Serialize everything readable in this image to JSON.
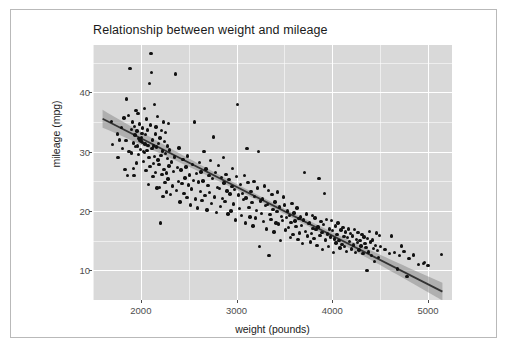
{
  "chart_data": {
    "type": "scatter",
    "title": "Relationship between weight and mileage",
    "xlabel": "weight (pounds)",
    "ylabel": "mileage (mpg)",
    "xlim": [
      1500,
      5250
    ],
    "ylim": [
      5,
      48
    ],
    "x_ticks": [
      2000,
      3000,
      4000,
      5000
    ],
    "x_tick_labels": [
      "2000",
      "3000",
      "4000",
      "5000"
    ],
    "y_ticks": [
      10,
      20,
      30,
      40
    ],
    "y_tick_labels": [
      "10",
      "20",
      "30",
      "40"
    ],
    "x_minor_ticks": [
      1500,
      2500,
      3500,
      4500,
      5000
    ],
    "y_minor_ticks": [
      15,
      25,
      35,
      45
    ],
    "grid": true,
    "legend": "none",
    "panel_background": "#d9d9d9",
    "grid_color": "#ffffff",
    "point_color": "#111111",
    "fit_line_color": "#333333",
    "fit_ribbon_color": "#8c8c8c",
    "fit": {
      "type": "linear",
      "intercept": 48.7,
      "slope": -0.00821,
      "x_start": 1600,
      "x_end": 5150,
      "ci_halfwidth_min": 0.45,
      "ci_halfwidth_max": 1.5
    },
    "points": [
      [
        1695,
        35.1
      ],
      [
        1705,
        31.2
      ],
      [
        1755,
        33.0
      ],
      [
        1760,
        29.0
      ],
      [
        1775,
        32.0
      ],
      [
        1800,
        34.1
      ],
      [
        1810,
        30.5
      ],
      [
        1825,
        35.7
      ],
      [
        1835,
        27.0
      ],
      [
        1845,
        31.9
      ],
      [
        1850,
        38.9
      ],
      [
        1860,
        26.0
      ],
      [
        1870,
        36.1
      ],
      [
        1875,
        30.0
      ],
      [
        1885,
        44.0
      ],
      [
        1900,
        33.8
      ],
      [
        1905,
        29.8
      ],
      [
        1915,
        35.0
      ],
      [
        1920,
        31.5
      ],
      [
        1925,
        27.2
      ],
      [
        1930,
        26.0
      ],
      [
        1935,
        34.3
      ],
      [
        1940,
        32.8
      ],
      [
        1945,
        30.9
      ],
      [
        1950,
        37.0
      ],
      [
        1955,
        28.1
      ],
      [
        1960,
        33.5
      ],
      [
        1965,
        31.0
      ],
      [
        1970,
        36.4
      ],
      [
        1975,
        29.5
      ],
      [
        1980,
        32.2
      ],
      [
        1985,
        34.7
      ],
      [
        1990,
        31.9
      ],
      [
        1995,
        30.4
      ],
      [
        2000,
        31.8
      ],
      [
        2005,
        32.4
      ],
      [
        2010,
        33.1
      ],
      [
        2015,
        31.6
      ],
      [
        2020,
        34.0
      ],
      [
        2025,
        30.0
      ],
      [
        2030,
        28.4
      ],
      [
        2035,
        37.3
      ],
      [
        2040,
        29.9
      ],
      [
        2045,
        31.3
      ],
      [
        2050,
        32.9
      ],
      [
        2055,
        26.8
      ],
      [
        2060,
        35.5
      ],
      [
        2065,
        30.2
      ],
      [
        2070,
        33.7
      ],
      [
        2075,
        31.1
      ],
      [
        2080,
        24.5
      ],
      [
        2085,
        29.0
      ],
      [
        2090,
        41.5
      ],
      [
        2095,
        27.5
      ],
      [
        2100,
        34.5
      ],
      [
        2105,
        46.6
      ],
      [
        2110,
        43.4
      ],
      [
        2115,
        30.5
      ],
      [
        2120,
        32.0
      ],
      [
        2125,
        25.8
      ],
      [
        2130,
        28.0
      ],
      [
        2135,
        31.0
      ],
      [
        2140,
        38.0
      ],
      [
        2145,
        29.2
      ],
      [
        2150,
        33.0
      ],
      [
        2155,
        26.5
      ],
      [
        2160,
        34.2
      ],
      [
        2165,
        30.8
      ],
      [
        2170,
        23.9
      ],
      [
        2175,
        35.9
      ],
      [
        2180,
        28.6
      ],
      [
        2185,
        31.4
      ],
      [
        2190,
        27.8
      ],
      [
        2195,
        24.0
      ],
      [
        2200,
        32.3
      ],
      [
        2205,
        18.0
      ],
      [
        2210,
        29.4
      ],
      [
        2215,
        33.6
      ],
      [
        2220,
        26.2
      ],
      [
        2225,
        30.1
      ],
      [
        2230,
        22.5
      ],
      [
        2235,
        35.0
      ],
      [
        2240,
        27.0
      ],
      [
        2245,
        31.7
      ],
      [
        2250,
        24.8
      ],
      [
        2255,
        29.7
      ],
      [
        2260,
        33.2
      ],
      [
        2265,
        26.4
      ],
      [
        2270,
        23.2
      ],
      [
        2275,
        28.9
      ],
      [
        2280,
        31.0
      ],
      [
        2285,
        25.4
      ],
      [
        2290,
        34.8
      ],
      [
        2295,
        27.6
      ],
      [
        2300,
        30.3
      ],
      [
        2310,
        22.8
      ],
      [
        2320,
        28.3
      ],
      [
        2330,
        24.2
      ],
      [
        2340,
        26.7
      ],
      [
        2350,
        29.1
      ],
      [
        2360,
        43.1
      ],
      [
        2370,
        23.5
      ],
      [
        2380,
        27.3
      ],
      [
        2390,
        25.0
      ],
      [
        2400,
        30.6
      ],
      [
        2410,
        21.5
      ],
      [
        2420,
        26.9
      ],
      [
        2430,
        24.6
      ],
      [
        2440,
        28.7
      ],
      [
        2450,
        23.0
      ],
      [
        2460,
        25.6
      ],
      [
        2470,
        27.4
      ],
      [
        2480,
        22.3
      ],
      [
        2490,
        29.3
      ],
      [
        2500,
        24.4
      ],
      [
        2510,
        26.1
      ],
      [
        2520,
        21.0
      ],
      [
        2530,
        23.7
      ],
      [
        2540,
        27.9
      ],
      [
        2550,
        25.2
      ],
      [
        2560,
        35.0
      ],
      [
        2570,
        22.0
      ],
      [
        2580,
        26.3
      ],
      [
        2590,
        20.5
      ],
      [
        2600,
        24.9
      ],
      [
        2610,
        28.2
      ],
      [
        2620,
        23.3
      ],
      [
        2630,
        26.6
      ],
      [
        2640,
        21.8
      ],
      [
        2650,
        25.1
      ],
      [
        2660,
        30.0
      ],
      [
        2670,
        22.6
      ],
      [
        2680,
        27.1
      ],
      [
        2690,
        20.2
      ],
      [
        2700,
        24.3
      ],
      [
        2710,
        26.0
      ],
      [
        2720,
        23.1
      ],
      [
        2730,
        28.5
      ],
      [
        2740,
        21.3
      ],
      [
        2750,
        25.5
      ],
      [
        2760,
        32.5
      ],
      [
        2770,
        22.4
      ],
      [
        2780,
        26.5
      ],
      [
        2790,
        19.8
      ],
      [
        2800,
        24.0
      ],
      [
        2810,
        27.7
      ],
      [
        2820,
        23.8
      ],
      [
        2830,
        20.8
      ],
      [
        2840,
        25.7
      ],
      [
        2850,
        22.1
      ],
      [
        2860,
        29.0
      ],
      [
        2870,
        24.7
      ],
      [
        2880,
        21.6
      ],
      [
        2890,
        26.2
      ],
      [
        2900,
        23.4
      ],
      [
        2910,
        19.5
      ],
      [
        2920,
        25.3
      ],
      [
        2930,
        22.9
      ],
      [
        2940,
        20.0
      ],
      [
        2950,
        24.1
      ],
      [
        2960,
        27.2
      ],
      [
        2970,
        21.2
      ],
      [
        2980,
        23.6
      ],
      [
        2990,
        18.5
      ],
      [
        3000,
        25.8
      ],
      [
        3010,
        38.0
      ],
      [
        3020,
        22.7
      ],
      [
        3030,
        20.4
      ],
      [
        3040,
        24.5
      ],
      [
        3050,
        19.2
      ],
      [
        3060,
        23.0
      ],
      [
        3070,
        21.9
      ],
      [
        3080,
        26.0
      ],
      [
        3090,
        18.0
      ],
      [
        3100,
        22.2
      ],
      [
        3110,
        30.5
      ],
      [
        3120,
        24.8
      ],
      [
        3130,
        20.6
      ],
      [
        3140,
        19.0
      ],
      [
        3150,
        23.3
      ],
      [
        3160,
        21.4
      ],
      [
        3170,
        17.5
      ],
      [
        3180,
        25.0
      ],
      [
        3190,
        22.5
      ],
      [
        3200,
        18.8
      ],
      [
        3210,
        20.1
      ],
      [
        3220,
        23.9
      ],
      [
        3230,
        30.0
      ],
      [
        3240,
        14.0
      ],
      [
        3250,
        21.7
      ],
      [
        3260,
        19.6
      ],
      [
        3270,
        22.0
      ],
      [
        3280,
        18.2
      ],
      [
        3290,
        24.2
      ],
      [
        3300,
        20.9
      ],
      [
        3310,
        17.0
      ],
      [
        3320,
        21.1
      ],
      [
        3330,
        23.5
      ],
      [
        3340,
        12.5
      ],
      [
        3350,
        19.4
      ],
      [
        3360,
        18.6
      ],
      [
        3370,
        22.8
      ],
      [
        3380,
        20.3
      ],
      [
        3390,
        16.5
      ],
      [
        3400,
        21.5
      ],
      [
        3410,
        18.0
      ],
      [
        3420,
        19.9
      ],
      [
        3430,
        23.2
      ],
      [
        3440,
        17.8
      ],
      [
        3450,
        20.7
      ],
      [
        3460,
        15.0
      ],
      [
        3470,
        19.1
      ],
      [
        3480,
        18.4
      ],
      [
        3490,
        22.4
      ],
      [
        3500,
        21.0
      ],
      [
        3510,
        16.8
      ],
      [
        3520,
        18.9
      ],
      [
        3530,
        20.0
      ],
      [
        3540,
        17.2
      ],
      [
        3550,
        19.3
      ],
      [
        3560,
        15.5
      ],
      [
        3570,
        18.1
      ],
      [
        3580,
        21.3
      ],
      [
        3590,
        16.0
      ],
      [
        3600,
        19.7
      ],
      [
        3610,
        18.3
      ],
      [
        3620,
        17.4
      ],
      [
        3630,
        20.5
      ],
      [
        3640,
        15.2
      ],
      [
        3650,
        18.7
      ],
      [
        3660,
        16.3
      ],
      [
        3670,
        19.0
      ],
      [
        3680,
        17.6
      ],
      [
        3690,
        14.5
      ],
      [
        3700,
        18.5
      ],
      [
        3710,
        26.5
      ],
      [
        3720,
        16.6
      ],
      [
        3730,
        19.5
      ],
      [
        3740,
        15.8
      ],
      [
        3750,
        17.9
      ],
      [
        3760,
        18.0
      ],
      [
        3770,
        14.8
      ],
      [
        3780,
        16.2
      ],
      [
        3790,
        19.2
      ],
      [
        3800,
        17.1
      ],
      [
        3810,
        15.4
      ],
      [
        3820,
        18.8
      ],
      [
        3830,
        16.9
      ],
      [
        3840,
        14.2
      ],
      [
        3850,
        17.3
      ],
      [
        3860,
        25.5
      ],
      [
        3870,
        15.9
      ],
      [
        3880,
        18.2
      ],
      [
        3890,
        16.4
      ],
      [
        3900,
        13.5
      ],
      [
        3910,
        17.7
      ],
      [
        3920,
        23.0
      ],
      [
        3930,
        15.1
      ],
      [
        3940,
        18.6
      ],
      [
        3950,
        16.1
      ],
      [
        3960,
        14.0
      ],
      [
        3970,
        17.0
      ],
      [
        3980,
        15.6
      ],
      [
        3990,
        18.4
      ],
      [
        4000,
        16.7
      ],
      [
        4010,
        13.0
      ],
      [
        4020,
        15.3
      ],
      [
        4030,
        17.5
      ],
      [
        4040,
        14.6
      ],
      [
        4050,
        16.0
      ],
      [
        4060,
        18.0
      ],
      [
        4070,
        15.0
      ],
      [
        4080,
        13.8
      ],
      [
        4090,
        16.8
      ],
      [
        4100,
        14.4
      ],
      [
        4110,
        17.2
      ],
      [
        4120,
        15.7
      ],
      [
        4130,
        14.0
      ],
      [
        4140,
        16.5
      ],
      [
        4150,
        13.2
      ],
      [
        4160,
        15.5
      ],
      [
        4170,
        17.0
      ],
      [
        4180,
        14.9
      ],
      [
        4190,
        16.2
      ],
      [
        4200,
        13.6
      ],
      [
        4210,
        15.8
      ],
      [
        4220,
        14.3
      ],
      [
        4230,
        16.9
      ],
      [
        4240,
        13.0
      ],
      [
        4250,
        15.2
      ],
      [
        4260,
        14.7
      ],
      [
        4270,
        16.4
      ],
      [
        4280,
        13.4
      ],
      [
        4290,
        15.0
      ],
      [
        4300,
        14.1
      ],
      [
        4310,
        16.0
      ],
      [
        4320,
        12.8
      ],
      [
        4330,
        15.6
      ],
      [
        4340,
        14.5
      ],
      [
        4350,
        13.9
      ],
      [
        4360,
        10.0
      ],
      [
        4370,
        15.4
      ],
      [
        4380,
        13.1
      ],
      [
        4390,
        16.6
      ],
      [
        4400,
        14.8
      ],
      [
        4410,
        12.5
      ],
      [
        4420,
        15.1
      ],
      [
        4430,
        13.7
      ],
      [
        4440,
        11.5
      ],
      [
        4450,
        14.2
      ],
      [
        4460,
        16.3
      ],
      [
        4470,
        13.3
      ],
      [
        4480,
        12.2
      ],
      [
        4490,
        15.9
      ],
      [
        4500,
        14.0
      ],
      [
        4550,
        13.5
      ],
      [
        4600,
        12.8
      ],
      [
        4620,
        15.8
      ],
      [
        4650,
        13.0
      ],
      [
        4680,
        10.2
      ],
      [
        4700,
        12.5
      ],
      [
        4720,
        14.1
      ],
      [
        4750,
        13.2
      ],
      [
        4780,
        9.0
      ],
      [
        4800,
        12.0
      ],
      [
        4850,
        12.6
      ],
      [
        4900,
        11.0
      ],
      [
        4950,
        11.2
      ],
      [
        4960,
        11.3
      ],
      [
        5000,
        10.8
      ],
      [
        5140,
        12.7
      ]
    ]
  }
}
